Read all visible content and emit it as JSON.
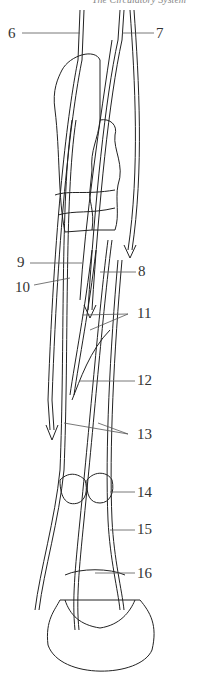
{
  "header": {
    "text": "The Circulatory System"
  },
  "labels": [
    {
      "id": "6",
      "text": "6",
      "x": 8,
      "y": 26
    },
    {
      "id": "7",
      "text": "7",
      "x": 156,
      "y": 26
    },
    {
      "id": "8",
      "text": "8",
      "x": 138,
      "y": 264
    },
    {
      "id": "9",
      "text": "9",
      "x": 17,
      "y": 233
    },
    {
      "id": "10",
      "text": "10",
      "x": 15,
      "y": 255
    },
    {
      "id": "11",
      "text": "11",
      "x": 137,
      "y": 306
    },
    {
      "id": "12",
      "text": "12",
      "x": 137,
      "y": 373
    },
    {
      "id": "13",
      "text": "13",
      "x": 137,
      "y": 427
    },
    {
      "id": "14",
      "text": "14",
      "x": 137,
      "y": 485
    },
    {
      "id": "15",
      "text": "15",
      "x": 137,
      "y": 522
    },
    {
      "id": "16",
      "text": "16",
      "x": 137,
      "y": 566
    }
  ],
  "colors": {
    "line": "#222222",
    "leader": "#555555",
    "background": "#ffffff"
  }
}
